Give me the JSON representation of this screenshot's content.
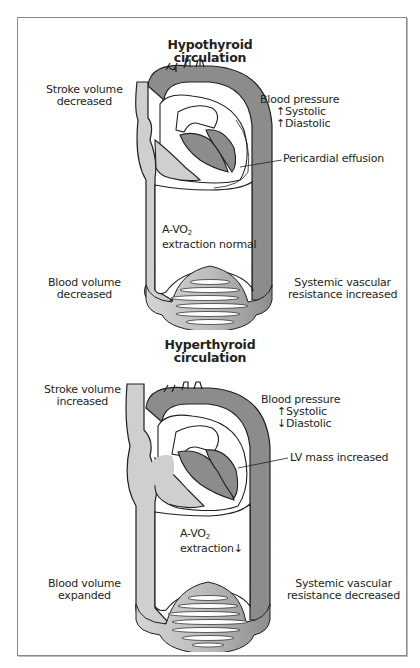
{
  "figure": {
    "panels": [
      {
        "id": "hypothyroid",
        "title_line1": "Hypothyroid",
        "title_line2": "circulation",
        "stroke_volume": {
          "line1": "Stroke volume",
          "line2": "decreased"
        },
        "blood_pressure": {
          "line1": "Blood pressure",
          "systolic_arrow": "↑",
          "systolic": "Systolic",
          "diastolic_arrow": "↑",
          "diastolic": "Diastolic"
        },
        "callout": "Pericardial effusion",
        "avo2": {
          "prefix": "A-VO",
          "subscript": "2",
          "line2": "extraction normal"
        },
        "blood_volume": {
          "line1": "Blood volume",
          "line2": "decreased"
        },
        "svr": {
          "line1": "Systemic vascular",
          "line2": "resistance increased"
        }
      },
      {
        "id": "hyperthyroid",
        "title_line1": "Hyperthyroid",
        "title_line2": "circulation",
        "stroke_volume": {
          "line1": "Stroke volume",
          "line2": "increased"
        },
        "blood_pressure": {
          "line1": "Blood pressure",
          "systolic_arrow": "↑",
          "systolic": "Systolic",
          "diastolic_arrow": "↓",
          "diastolic": "Diastolic"
        },
        "callout": "LV mass increased",
        "avo2": {
          "prefix": "A-VO",
          "subscript": "2",
          "line2": "extraction↓"
        },
        "blood_volume": {
          "line1": "Blood volume",
          "line2": "expanded"
        },
        "svr": {
          "line1": "Systemic vascular",
          "line2": "resistance decreased"
        }
      }
    ],
    "colors": {
      "dark_gray_arterial": "#8c8c8c",
      "light_gray_venous": "#cfcfcf",
      "outline": "#231f20",
      "frame_border": "#8a8a8a"
    }
  }
}
